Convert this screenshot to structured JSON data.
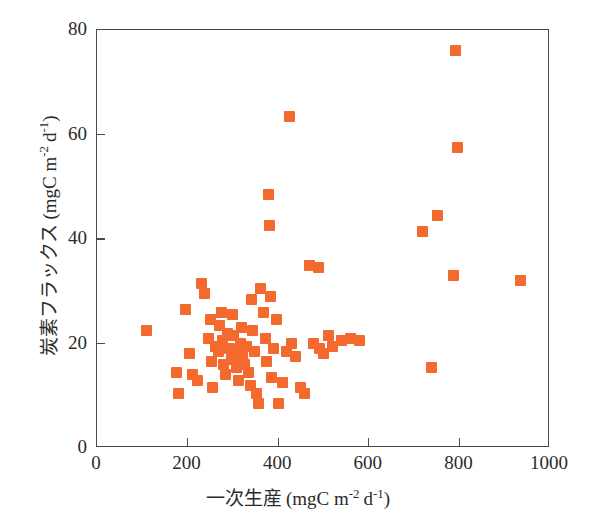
{
  "chart_data": {
    "type": "scatter",
    "title": "",
    "xlabel": "一次生産 (mgC m⁻² d⁻¹)",
    "ylabel": "炭素フラックス (mgC m⁻² d⁻¹)",
    "xlabel_parts": {
      "jp": "一次生産",
      "unit_pre": "(mgC m",
      "unit_sup1": "-2",
      "unit_mid": "d",
      "unit_sup2": "-1",
      "unit_post": ")"
    },
    "ylabel_parts": {
      "jp": "炭素フラックス",
      "unit_pre": "(mgC m",
      "unit_sup1": "-2",
      "unit_mid": "d",
      "unit_sup2": "-1",
      "unit_post": ")"
    },
    "xlim": [
      0,
      1000
    ],
    "ylim": [
      0,
      80
    ],
    "xticks": [
      0,
      200,
      400,
      600,
      800,
      1000
    ],
    "yticks": [
      0,
      20,
      40,
      60,
      80
    ],
    "xticklabels": [
      "0",
      "200",
      "400",
      "600",
      "800",
      "1000"
    ],
    "yticklabels": [
      "0",
      "20",
      "40",
      "60",
      "80"
    ],
    "grid": false,
    "legend": null,
    "marker_color": "#f4692e",
    "marker_shape": "square",
    "series": [
      {
        "name": "observations",
        "points": [
          [
            110,
            22.5
          ],
          [
            175,
            14.5
          ],
          [
            180,
            10.5
          ],
          [
            196,
            26.5
          ],
          [
            205,
            18.0
          ],
          [
            210,
            14.0
          ],
          [
            222,
            13.0
          ],
          [
            230,
            31.5
          ],
          [
            238,
            29.5
          ],
          [
            246,
            21.0
          ],
          [
            250,
            24.5
          ],
          [
            252,
            16.5
          ],
          [
            256,
            11.5
          ],
          [
            262,
            19.5
          ],
          [
            268,
            18.5
          ],
          [
            270,
            23.5
          ],
          [
            274,
            26.0
          ],
          [
            278,
            20.5
          ],
          [
            280,
            16.0
          ],
          [
            284,
            14.0
          ],
          [
            288,
            22.0
          ],
          [
            292,
            19.0
          ],
          [
            296,
            17.0
          ],
          [
            300,
            25.5
          ],
          [
            302,
            21.5
          ],
          [
            306,
            18.0
          ],
          [
            308,
            15.5
          ],
          [
            312,
            13.0
          ],
          [
            316,
            20.0
          ],
          [
            320,
            23.0
          ],
          [
            322,
            17.5
          ],
          [
            326,
            16.0
          ],
          [
            330,
            19.5
          ],
          [
            334,
            14.5
          ],
          [
            338,
            12.0
          ],
          [
            340,
            28.5
          ],
          [
            344,
            22.5
          ],
          [
            348,
            18.5
          ],
          [
            352,
            10.5
          ],
          [
            356,
            8.5
          ],
          [
            362,
            30.5
          ],
          [
            368,
            26.0
          ],
          [
            372,
            21.0
          ],
          [
            374,
            16.5
          ],
          [
            378,
            48.5
          ],
          [
            380,
            42.5
          ],
          [
            382,
            29.0
          ],
          [
            386,
            13.5
          ],
          [
            390,
            19.0
          ],
          [
            396,
            24.5
          ],
          [
            400,
            8.5
          ],
          [
            410,
            12.5
          ],
          [
            418,
            18.5
          ],
          [
            425,
            63.5
          ],
          [
            430,
            20.0
          ],
          [
            438,
            17.5
          ],
          [
            450,
            11.5
          ],
          [
            458,
            10.5
          ],
          [
            468,
            35.0
          ],
          [
            478,
            20.0
          ],
          [
            488,
            34.5
          ],
          [
            492,
            19.0
          ],
          [
            500,
            18.0
          ],
          [
            512,
            21.5
          ],
          [
            520,
            19.5
          ],
          [
            540,
            20.5
          ],
          [
            560,
            21.0
          ],
          [
            580,
            20.5
          ],
          [
            718,
            41.5
          ],
          [
            738,
            15.5
          ],
          [
            752,
            44.5
          ],
          [
            788,
            33.0
          ],
          [
            792,
            76.0
          ],
          [
            796,
            57.5
          ],
          [
            935,
            32.0
          ]
        ]
      }
    ]
  }
}
